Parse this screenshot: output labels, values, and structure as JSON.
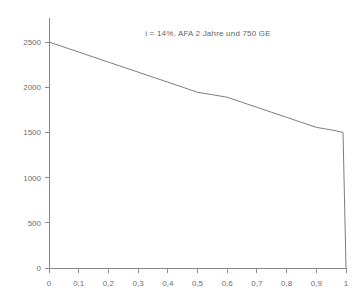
{
  "chart_data": {
    "type": "line",
    "title": "i = 14%, AFA 2 Jahre und 750 GE",
    "xlabel": "",
    "ylabel": "",
    "xlim": [
      0,
      1
    ],
    "ylim": [
      0,
      2500
    ],
    "grid": false,
    "legend": null,
    "x_ticks": [
      0,
      0.1,
      0.2,
      0.3,
      0.4,
      0.5,
      0.6,
      0.7,
      0.8,
      0.9,
      1
    ],
    "x_tick_labels": [
      "0",
      "0,1",
      "0,2",
      "0,3",
      "0,4",
      "0,5",
      "0,6",
      "0,7",
      "0,8",
      "0,9",
      "1"
    ],
    "y_ticks": [
      0,
      500,
      1000,
      1500,
      2000,
      2500
    ],
    "y_tick_labels": [
      "0",
      "500",
      "1000",
      "1500",
      "2000",
      "2500"
    ],
    "line_color": "#7d7d7d",
    "axis_color": "#8a8a8a",
    "series": [
      {
        "name": "Kapitalwert",
        "x": [
          0,
          0.05,
          0.1,
          0.15,
          0.2,
          0.25,
          0.3,
          0.35,
          0.4,
          0.45,
          0.5,
          0.55,
          0.6,
          0.65,
          0.7,
          0.75,
          0.8,
          0.85,
          0.9,
          0.95,
          0.99,
          0.99,
          1
        ],
        "y": [
          2500,
          2444,
          2389,
          2333,
          2278,
          2222,
          2167,
          2111,
          2056,
          2000,
          1944,
          1917,
          1889,
          1833,
          1778,
          1722,
          1667,
          1611,
          1556,
          1528,
          1500,
          1500,
          0
        ]
      }
    ]
  },
  "axis": {
    "y_axis_name": "y-axis",
    "x_axis_name": "x-axis"
  }
}
